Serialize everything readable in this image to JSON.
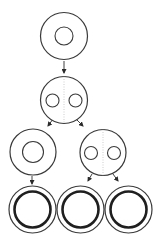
{
  "diagram": {
    "width": 161,
    "height": 243,
    "background": "#ffffff",
    "stroke_color": "#3a3a3a",
    "thick_stroke_color": "#1f1f1f",
    "divider_color": "#b8b8b8",
    "nodes": [
      {
        "id": "cell-1",
        "cx": 64,
        "cy": 36,
        "r": 23.5,
        "type": "single-nucleus",
        "inner": [
          {
            "cx": 64,
            "cy": 36,
            "r": 9
          }
        ]
      },
      {
        "id": "cell-2",
        "cx": 64,
        "cy": 100,
        "r": 23.5,
        "type": "two-nuclei-divider",
        "inner": [
          {
            "cx": 52.5,
            "cy": 100.5,
            "r": 6.5
          },
          {
            "cx": 75.5,
            "cy": 100.5,
            "r": 6.5
          }
        ]
      },
      {
        "id": "cell-3a",
        "cx": 33,
        "cy": 152,
        "r": 23,
        "type": "single-nucleus",
        "inner": [
          {
            "cx": 33,
            "cy": 152,
            "r": 10.5
          }
        ]
      },
      {
        "id": "cell-3b",
        "cx": 103,
        "cy": 152.5,
        "r": 23,
        "type": "two-nuclei-divider",
        "inner": [
          {
            "cx": 91,
            "cy": 153,
            "r": 6.5
          },
          {
            "cx": 114,
            "cy": 153,
            "r": 6.5
          }
        ]
      },
      {
        "id": "cell-4a",
        "cx": 32.5,
        "cy": 209.5,
        "r": 23.5,
        "type": "double-ring",
        "inner_r": 18
      },
      {
        "id": "cell-4b",
        "cx": 80.5,
        "cy": 209.5,
        "r": 23.5,
        "type": "double-ring",
        "inner_r": 18
      },
      {
        "id": "cell-4c",
        "cx": 128.5,
        "cy": 209.5,
        "r": 23.5,
        "type": "double-ring",
        "inner_r": 18
      }
    ],
    "arrows": [
      {
        "from": "cell-1",
        "to": "cell-2",
        "x1": 64,
        "y1": 61,
        "x2": 64,
        "y2": 73
      },
      {
        "from": "cell-2",
        "to": "cell-3a",
        "x1": 53,
        "y1": 119,
        "x2": 48,
        "y2": 126
      },
      {
        "from": "cell-2",
        "to": "cell-3b",
        "x1": 76,
        "y1": 119,
        "x2": 83,
        "y2": 126
      },
      {
        "from": "cell-3a",
        "to": "cell-4a",
        "x1": 32,
        "y1": 176,
        "x2": 32,
        "y2": 184
      },
      {
        "from": "cell-3b",
        "to": "cell-4b",
        "x1": 92,
        "y1": 174,
        "x2": 88,
        "y2": 181
      },
      {
        "from": "cell-3b",
        "to": "cell-4c",
        "x1": 113,
        "y1": 174,
        "x2": 118,
        "y2": 181
      }
    ]
  }
}
